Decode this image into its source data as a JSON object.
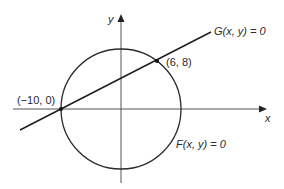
{
  "diagram": {
    "axes": {
      "x_label": "x",
      "y_label": "y"
    },
    "curves": {
      "circle": {
        "label": "F(x, y) = 0",
        "center": [
          0,
          0
        ],
        "radius": 10
      },
      "line": {
        "label": "G(x, y) = 0"
      }
    },
    "points": [
      {
        "label": "(−10, 0)",
        "coords": [
          -10,
          0
        ]
      },
      {
        "label": "(6, 8)",
        "coords": [
          6,
          8
        ]
      }
    ],
    "colors": {
      "stroke": "#2a2a2a",
      "axis": "#555555",
      "background": "#ffffff"
    }
  }
}
